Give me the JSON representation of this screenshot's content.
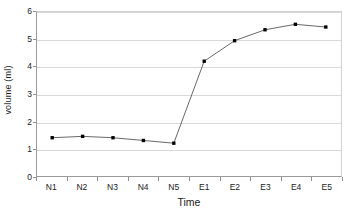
{
  "chart_data": {
    "type": "line",
    "title": "",
    "subtitle": "",
    "xlabel": "Time",
    "ylabel": "volume (ml)",
    "categories": [
      "N1",
      "N2",
      "N3",
      "N4",
      "N5",
      "E1",
      "E2",
      "E3",
      "E4",
      "E5"
    ],
    "values": [
      1.4,
      1.45,
      1.4,
      1.3,
      1.2,
      4.2,
      4.95,
      5.35,
      5.55,
      5.45
    ],
    "series": [
      {
        "name": "volume",
        "values": [
          1.4,
          1.45,
          1.4,
          1.3,
          1.2,
          4.2,
          4.95,
          5.35,
          5.55,
          5.45
        ]
      }
    ],
    "ylim": [
      0,
      6
    ],
    "yticks": [
      0,
      1,
      2,
      3,
      4,
      5,
      6
    ],
    "ytick_labels": [
      "0",
      "1",
      "2",
      "3",
      "4",
      "5",
      "6"
    ],
    "grid": "horizontal",
    "legend": "none",
    "marker": "square",
    "marker_color": "#000000",
    "line_color": "#555555",
    "gridline_color": "#d8d8d8",
    "axis_color": "#9a9a9a",
    "background": "#ffffff"
  }
}
